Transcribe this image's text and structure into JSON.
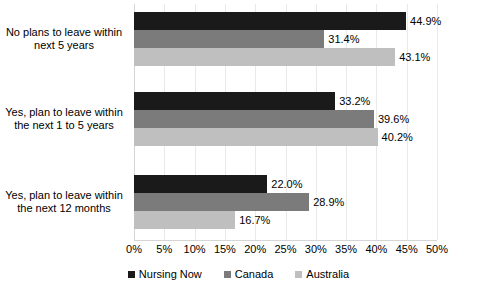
{
  "chart_data": {
    "type": "bar",
    "orientation": "horizontal",
    "title": "",
    "xlabel": "",
    "ylabel": "",
    "xlim": [
      0,
      50
    ],
    "xtick_step": 5,
    "xticks": [
      "0%",
      "5%",
      "10%",
      "15%",
      "20%",
      "25%",
      "30%",
      "35%",
      "40%",
      "45%",
      "50%"
    ],
    "grid": true,
    "legend_position": "bottom",
    "value_suffix": "%",
    "categories": [
      "No plans to leave within next 5 years",
      "Yes, plan to leave within the next 1 to 5 years",
      "Yes, plan to leave within the next 12 months"
    ],
    "category_lines": [
      [
        "No plans to leave within",
        "next 5 years"
      ],
      [
        "Yes, plan to leave within",
        "the next 1 to 5 years"
      ],
      [
        "Yes, plan to leave within",
        "the next 12 months"
      ]
    ],
    "series": [
      {
        "name": "Nursing Now",
        "color": "#1a1a1a",
        "values": [
          44.9,
          33.2,
          22.0
        ],
        "labels": [
          "44.9%",
          "33.2%",
          "22.0%"
        ]
      },
      {
        "name": "Canada",
        "color": "#7b7b7b",
        "values": [
          31.4,
          39.6,
          28.9
        ],
        "labels": [
          "31.4%",
          "39.6%",
          "28.9%"
        ]
      },
      {
        "name": "Australia",
        "color": "#bfbfbf",
        "values": [
          43.1,
          40.2,
          16.7
        ],
        "labels": [
          "43.1%",
          "40.2%",
          "16.7%"
        ]
      }
    ]
  },
  "legend": {
    "items": [
      {
        "label": "Nursing Now",
        "color": "#1a1a1a"
      },
      {
        "label": "Canada",
        "color": "#7b7b7b"
      },
      {
        "label": "Australia",
        "color": "#bfbfbf"
      }
    ]
  }
}
